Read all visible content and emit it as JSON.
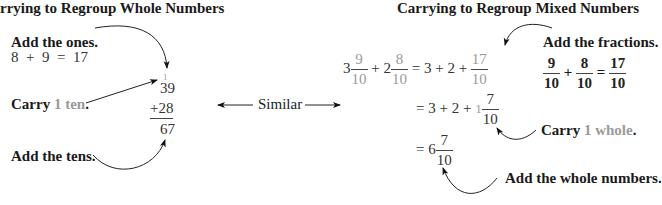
{
  "left": {
    "title": "rrying to Regroup Whole Numbers",
    "step_ones": "Add the ones.",
    "ones_equation": "8  +  9  =  17",
    "carry_label": "Carry",
    "carry_value": "1 ten",
    "carry_period": ".",
    "carry_digit": "1",
    "addend1": "39",
    "addend2": "+28",
    "sum": "67",
    "step_tens": "Add the tens."
  },
  "middle": {
    "similar_label": "Similar"
  },
  "right": {
    "title": "Carrying to Regroup Mixed Numbers",
    "line1": {
      "whole1": "3",
      "num1": "9",
      "den1": "10",
      "plus1": "+",
      "whole2": "2",
      "num2": "8",
      "den2": "10",
      "rhs": "= 3 + 2 +",
      "rnum": "17",
      "rden": "10"
    },
    "step_fractions": "Add the fractions.",
    "fraction_sum": {
      "n1": "9",
      "d1": "10",
      "op": "+",
      "n2": "8",
      "d2": "10",
      "eq": "=",
      "n3": "17",
      "d3": "10"
    },
    "line2": {
      "lhs": "= 3 + 2 +",
      "carry_whole": "1",
      "num": "7",
      "den": "10"
    },
    "carry_label": "Carry",
    "carry_value": "1 whole",
    "carry_period": ".",
    "line3": {
      "lhs": "= 6",
      "num": "7",
      "den": "10"
    },
    "step_whole": "Add the whole numbers."
  }
}
